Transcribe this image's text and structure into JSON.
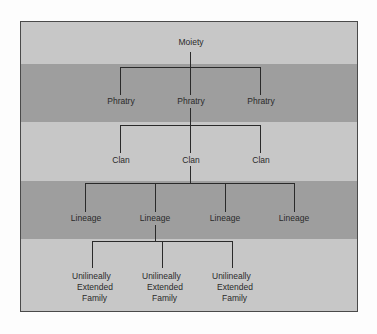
{
  "diagram": {
    "type": "hierarchy",
    "colors": {
      "light_band": "#c7c7c7",
      "dark_band": "#9e9e9e",
      "line": "#2a2a2a",
      "border": "#4a4a4a"
    },
    "levels": [
      {
        "name": "moiety",
        "nodes": [
          "Moiety"
        ]
      },
      {
        "name": "phratry",
        "nodes": [
          "Phratry",
          "Phratry",
          "Phratry"
        ]
      },
      {
        "name": "clan",
        "nodes": [
          "Clan",
          "Clan",
          "Clan"
        ]
      },
      {
        "name": "lineage",
        "nodes": [
          "Lineage",
          "Lineage",
          "Lineage",
          "Lineage"
        ]
      },
      {
        "name": "family",
        "nodes": [
          {
            "line1": "Unilineally",
            "line2": "Extended",
            "line3": "Family"
          },
          {
            "line1": "Unilineally",
            "line2": "Extended",
            "line3": "Family"
          },
          {
            "line1": "Unilineally",
            "line2": "Extended",
            "line3": "Family"
          }
        ]
      }
    ],
    "edges": [
      {
        "from": "Moiety",
        "to": [
          "Phratry 1",
          "Phratry 2",
          "Phratry 3"
        ]
      },
      {
        "from": "Phratry 2",
        "to": [
          "Clan 1",
          "Clan 2",
          "Clan 3"
        ]
      },
      {
        "from": "Clan 2",
        "to": [
          "Lineage 1",
          "Lineage 2",
          "Lineage 3",
          "Lineage 4"
        ]
      },
      {
        "from": "Lineage 2",
        "to": [
          "Family 1",
          "Family 2",
          "Family 3"
        ]
      }
    ]
  }
}
